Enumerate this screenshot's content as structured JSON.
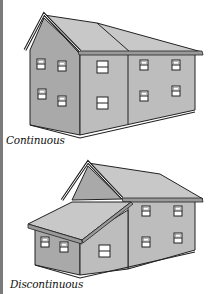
{
  "figures": [
    {
      "id": "continuous",
      "caption": "Continuous"
    },
    {
      "id": "discontinuous",
      "caption": "Discontinuous"
    }
  ],
  "colors": {
    "wall_front": "#bdbdbd",
    "wall_side": "#a9a9a9",
    "roof": "#c8c8c8",
    "roof_dark": "#b4b4b4",
    "window_glass": "#ffffff",
    "outline": "#222222",
    "left_edge": "#7a7a7a"
  }
}
